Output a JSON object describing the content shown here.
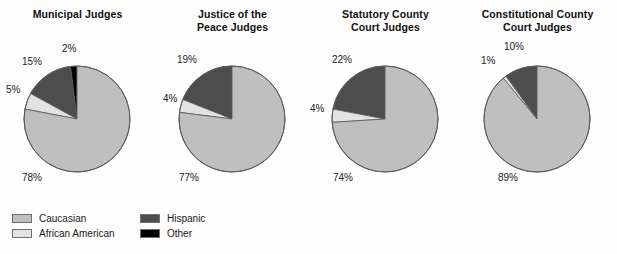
{
  "figure": {
    "background_color": "#fdfdfd",
    "text_color": "#1a1a1a"
  },
  "legend": {
    "position": "bottom-left",
    "entries": [
      {
        "label": "Caucasian",
        "color": "#bfbfbf",
        "row": 0,
        "col": 0
      },
      {
        "label": "African American",
        "color": "#e2e2e2",
        "row": 1,
        "col": 0
      },
      {
        "label": "Hispanic",
        "color": "#4d4d4d",
        "row": 0,
        "col": 1
      },
      {
        "label": "Other",
        "color": "#000000",
        "row": 1,
        "col": 1
      }
    ]
  },
  "chart_data": [
    {
      "type": "pie",
      "title": "Municipal Judges",
      "title_lines": [
        "Municipal Judges"
      ],
      "categories": [
        "Caucasian",
        "African American",
        "Hispanic",
        "Other"
      ],
      "values": [
        78,
        5,
        15,
        2
      ],
      "value_labels": [
        "78%",
        "5%",
        "15%",
        "2%"
      ],
      "colors": [
        "#bfbfbf",
        "#e2e2e2",
        "#4d4d4d",
        "#000000"
      ],
      "units": "percent",
      "start_angle_deg": 90,
      "direction": "counterclockwise",
      "draw_order": [
        "Other",
        "Hispanic",
        "African American",
        "Caucasian"
      ],
      "label_positions": [
        {
          "label": "78%",
          "x": 22,
          "y": 172
        },
        {
          "label": "5%",
          "x": 6,
          "y": 84
        },
        {
          "label": "15%",
          "x": 22,
          "y": 56
        },
        {
          "label": "2%",
          "x": 62,
          "y": 43
        }
      ]
    },
    {
      "type": "pie",
      "title": "Justice of the Peace Judges",
      "title_lines": [
        "Justice of the",
        "Peace Judges"
      ],
      "categories": [
        "Caucasian",
        "African American",
        "Hispanic",
        "Other"
      ],
      "values": [
        77,
        4,
        19,
        0
      ],
      "value_labels": [
        "77%",
        "4%",
        "19%",
        ""
      ],
      "colors": [
        "#bfbfbf",
        "#e2e2e2",
        "#4d4d4d",
        "#000000"
      ],
      "units": "percent",
      "start_angle_deg": 90,
      "direction": "counterclockwise",
      "draw_order": [
        "Other",
        "Hispanic",
        "African American",
        "Caucasian"
      ],
      "label_positions": [
        {
          "label": "77%",
          "x": 24,
          "y": 172
        },
        {
          "label": "4%",
          "x": 8,
          "y": 93
        },
        {
          "label": "19%",
          "x": 22,
          "y": 54
        }
      ]
    },
    {
      "type": "pie",
      "title": "Statutory County Court Judges",
      "title_lines": [
        "Statutory County",
        "Court Judges"
      ],
      "categories": [
        "Caucasian",
        "African American",
        "Hispanic",
        "Other"
      ],
      "values": [
        74,
        4,
        22,
        0
      ],
      "value_labels": [
        "74%",
        "4%",
        "22%",
        ""
      ],
      "colors": [
        "#bfbfbf",
        "#e2e2e2",
        "#4d4d4d",
        "#000000"
      ],
      "units": "percent",
      "start_angle_deg": 90,
      "direction": "counterclockwise",
      "draw_order": [
        "Other",
        "Hispanic",
        "African American",
        "Caucasian"
      ],
      "label_positions": [
        {
          "label": "74%",
          "x": 25,
          "y": 172
        },
        {
          "label": "4%",
          "x": 2,
          "y": 103
        },
        {
          "label": "22%",
          "x": 24,
          "y": 54
        }
      ]
    },
    {
      "type": "pie",
      "title": "Constitutional County Court Judges",
      "title_lines": [
        "Constitutional County",
        "Court Judges"
      ],
      "categories": [
        "Caucasian",
        "African American",
        "Hispanic",
        "Other"
      ],
      "values": [
        89,
        1,
        10,
        0
      ],
      "value_labels": [
        "89%",
        "1%",
        "10%",
        ""
      ],
      "colors": [
        "#bfbfbf",
        "#e2e2e2",
        "#4d4d4d",
        "#000000"
      ],
      "units": "percent",
      "start_angle_deg": 90,
      "direction": "counterclockwise",
      "draw_order": [
        "Other",
        "Hispanic",
        "African American",
        "Caucasian"
      ],
      "label_positions": [
        {
          "label": "89%",
          "x": 38,
          "y": 172
        },
        {
          "label": "1%",
          "x": 21,
          "y": 55
        },
        {
          "label": "10%",
          "x": 44,
          "y": 41
        }
      ]
    }
  ]
}
